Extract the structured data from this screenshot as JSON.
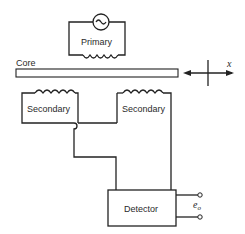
{
  "diagram": {
    "title": "",
    "type": "LVDT schematic",
    "nodes": [
      {
        "id": "primary",
        "label": "Primary",
        "has_ac_source": true
      },
      {
        "id": "core",
        "label": "Core"
      },
      {
        "id": "secondary_left",
        "label": "Secondary"
      },
      {
        "id": "secondary_right",
        "label": "Secondary"
      },
      {
        "id": "detector",
        "label": "Detector"
      }
    ],
    "motion_axis": {
      "label": "x"
    },
    "output": {
      "label_base": "e",
      "label_sub": "o"
    },
    "edges": [
      {
        "from": "secondary_left",
        "to": "secondary_right",
        "note": "series connection with wire crossover"
      },
      {
        "from": "secondary_left",
        "to": "detector"
      },
      {
        "from": "secondary_right",
        "to": "detector"
      },
      {
        "from": "detector",
        "to": "output_terminals"
      }
    ]
  }
}
